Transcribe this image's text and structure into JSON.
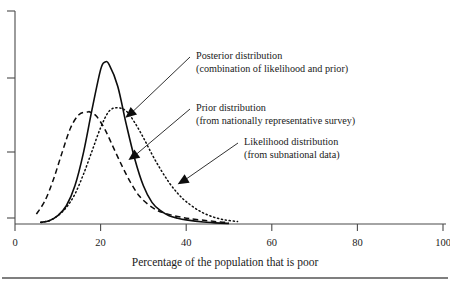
{
  "chart_data": {
    "type": "line",
    "title": "",
    "subtitle": "",
    "xlabel": "Percentage of the population that is poor",
    "ylabel": "",
    "xlim": [
      0,
      100
    ],
    "ylim": [
      0,
      1.0
    ],
    "xticks": [
      0,
      20,
      40,
      60,
      80,
      100
    ],
    "xtick_labels": [
      "0",
      "20",
      "40",
      "60",
      "80",
      "100"
    ],
    "yticks": [
      0.0,
      0.26,
      0.55,
      0.84
    ],
    "ytick_labels": [
      "",
      "",
      "",
      ""
    ],
    "grid": false,
    "legend_position": "annotations-inline",
    "series": [
      {
        "name": "Posterior distribution",
        "style": "solid",
        "color": "#0d0d0d",
        "peak_x": 21,
        "peak_y": 0.975,
        "sigma": 5.2,
        "x_start": 6,
        "x_end": 50,
        "points_x": [
          6,
          8,
          10,
          12,
          14,
          16,
          18,
          20,
          21,
          22,
          24,
          26,
          28,
          30,
          32,
          34,
          36,
          38,
          40,
          44,
          48,
          50
        ],
        "points_y": [
          0.01,
          0.02,
          0.05,
          0.11,
          0.23,
          0.43,
          0.69,
          0.93,
          0.975,
          0.96,
          0.83,
          0.6,
          0.39,
          0.23,
          0.13,
          0.08,
          0.05,
          0.035,
          0.025,
          0.012,
          0.005,
          0.004
        ]
      },
      {
        "name": "Prior distribution",
        "style": "dashed",
        "color": "#0d0d0d",
        "peak_x": 17.5,
        "peak_y": 0.675,
        "sigma": 6.6,
        "x_start": 5,
        "x_end": 50,
        "points_x": [
          5,
          7,
          9,
          11,
          13,
          15,
          17,
          17.5,
          19,
          21,
          23,
          25,
          27,
          29,
          31,
          33,
          35,
          38,
          41,
          45,
          48,
          50
        ],
        "points_y": [
          0.06,
          0.14,
          0.27,
          0.43,
          0.58,
          0.66,
          0.675,
          0.675,
          0.65,
          0.57,
          0.46,
          0.35,
          0.25,
          0.17,
          0.12,
          0.085,
          0.065,
          0.045,
          0.032,
          0.02,
          0.012,
          0.01
        ]
      },
      {
        "name": "Likelihood distribution",
        "style": "dotted",
        "color": "#0d0d0d",
        "peak_x": 24,
        "peak_y": 0.7,
        "sigma": 7.8,
        "x_start": 6,
        "x_end": 52,
        "points_x": [
          6,
          8,
          10,
          12,
          14,
          16,
          18,
          20,
          22,
          24,
          26,
          28,
          30,
          32,
          34,
          36,
          38,
          40,
          43,
          46,
          49,
          52
        ],
        "points_y": [
          0.01,
          0.02,
          0.05,
          0.1,
          0.18,
          0.3,
          0.44,
          0.58,
          0.68,
          0.7,
          0.68,
          0.61,
          0.52,
          0.42,
          0.33,
          0.25,
          0.185,
          0.135,
          0.08,
          0.045,
          0.025,
          0.015
        ]
      }
    ],
    "annotations": [
      {
        "id": "posterior",
        "line1": "Posterior distribution",
        "line2": "(combination of likelihood and prior)",
        "target_x": 25.8,
        "target_y": 0.64,
        "text_x": 196,
        "text_y": 59
      },
      {
        "id": "prior",
        "line1": "Prior distribution",
        "line2": "(from nationally representative survey)",
        "target_x": 26.5,
        "target_y": 0.385,
        "text_x": 196,
        "text_y": 111
      },
      {
        "id": "likelihood",
        "line1": "Likelihood distribution",
        "line2": "(from subnational data)",
        "target_x": 38,
        "target_y": 0.24,
        "text_x": 244,
        "text_y": 145
      }
    ]
  }
}
